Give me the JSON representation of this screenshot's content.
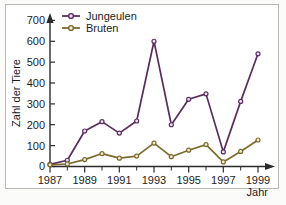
{
  "chart_data": {
    "type": "line",
    "title": "",
    "xlabel": "Jahr",
    "ylabel": "Zahl der Tiere",
    "x": [
      1987,
      1988,
      1989,
      1990,
      1991,
      1992,
      1993,
      1994,
      1995,
      1996,
      1997,
      1998,
      1999
    ],
    "xlim": [
      1987,
      1999
    ],
    "ylim": [
      0,
      700
    ],
    "xticks_major": [
      "1987",
      "1989",
      "1991",
      "1993",
      "1995",
      "1997",
      "1999"
    ],
    "yticks": [
      "0",
      "100",
      "200",
      "300",
      "400",
      "500",
      "600",
      "700"
    ],
    "grid": false,
    "legend_position": "top-left",
    "markers": "circle",
    "series": [
      {
        "name": "Jungeulen",
        "color": "#5b2d5e",
        "values": [
          10,
          30,
          170,
          215,
          160,
          218,
          600,
          200,
          322,
          348,
          70,
          312,
          540
        ]
      },
      {
        "name": "Bruten",
        "color": "#7d6b2c",
        "values": [
          8,
          12,
          33,
          62,
          40,
          50,
          112,
          47,
          78,
          105,
          22,
          72,
          127
        ]
      }
    ]
  },
  "legend": {
    "entries": [
      {
        "label": "Jungeulen"
      },
      {
        "label": "Bruten"
      }
    ]
  },
  "axes": {
    "y_title": "Zahl der Tiere",
    "x_title": "Jahr",
    "y_tick_labels": [
      "700",
      "600",
      "500",
      "400",
      "300",
      "200",
      "100",
      "0"
    ],
    "x_tick_labels": [
      "1987",
      "1989",
      "1991",
      "1993",
      "1995",
      "1997",
      "1999"
    ]
  },
  "colors": {
    "jungeulen": "#5b2d5e",
    "bruten": "#7d6b2c",
    "axis": "#2a2a2a",
    "frame": "#b9b9b4",
    "page_background": "#fbfbf9",
    "plot_background": "#ffffff"
  },
  "caption": {
    "cut_off_text": ""
  }
}
